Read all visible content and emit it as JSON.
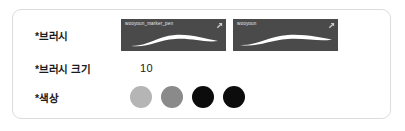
{
  "panel": {
    "background": "#ffffff",
    "border_color": "#dcdcdc"
  },
  "form": {
    "rows": [
      {
        "label": "*브러시",
        "type": "brush-thumbnails",
        "brushes": [
          {
            "name": "wooyoun_marker_pen",
            "background": "#4a4a4a",
            "stroke_color": "#ffffff",
            "selected": false
          },
          {
            "name": "wooyoun",
            "background": "#4a4a4a",
            "stroke_color": "#ffffff",
            "selected": false
          }
        ]
      },
      {
        "label": "*브러시 크기",
        "type": "value",
        "value": "10"
      },
      {
        "label": "*색상",
        "type": "color-swatches",
        "swatches": [
          {
            "name": "light-gray",
            "color": "#b5b5b5"
          },
          {
            "name": "medium-gray",
            "color": "#8a8a8a"
          },
          {
            "name": "black-1",
            "color": "#0c0c0c"
          },
          {
            "name": "black-2",
            "color": "#0c0c0c"
          }
        ]
      }
    ]
  },
  "icons": {
    "expand": "expand-arrow-icon"
  }
}
